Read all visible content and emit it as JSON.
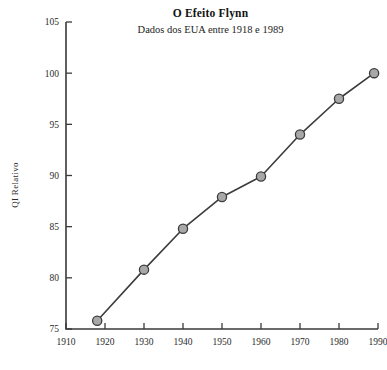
{
  "chart_data": {
    "type": "line",
    "title": "O Efeito Flynn",
    "subtitle": "Dados dos EUA entre 1918 e 1989",
    "xlabel": "",
    "ylabel": "QI Relativo",
    "xlim": [
      1910,
      1990
    ],
    "ylim": [
      75,
      105
    ],
    "xticks": [
      1910,
      1920,
      1930,
      1940,
      1950,
      1960,
      1970,
      1980,
      1990
    ],
    "yticks": [
      75,
      80,
      85,
      90,
      95,
      100,
      105
    ],
    "xtick_labels": [
      "1910",
      "1920",
      "1930",
      "1940",
      "1950",
      "1960",
      "1970",
      "1980",
      "1990"
    ],
    "ytick_labels": [
      "75",
      "80",
      "85",
      "90",
      "95",
      "100",
      "105"
    ],
    "grid": false,
    "legend": false,
    "marker": "circle",
    "marker_fill": "#a8a8a8",
    "line_color": "#3c3c3c",
    "x": [
      1918,
      1930,
      1940,
      1950,
      1960,
      1970,
      1980,
      1989
    ],
    "values": [
      75.8,
      80.8,
      84.8,
      87.9,
      89.9,
      94.0,
      97.5,
      100.0
    ],
    "series": [
      {
        "name": "QI Relativo",
        "x": [
          1918,
          1930,
          1940,
          1950,
          1960,
          1970,
          1980,
          1989
        ],
        "values": [
          75.8,
          80.8,
          84.8,
          87.9,
          89.9,
          94.0,
          97.5,
          100.0
        ]
      }
    ]
  }
}
